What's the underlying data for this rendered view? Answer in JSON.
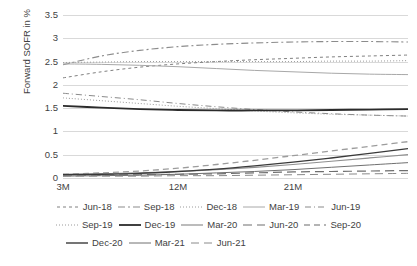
{
  "chart_data": {
    "type": "line",
    "title": "",
    "xlabel": "",
    "ylabel": "Forward SOFR in %",
    "ylim": [
      0,
      3.5
    ],
    "yticks": [
      "0",
      "0.5",
      "1",
      "1.5",
      "2",
      "2.5",
      "3",
      "3.5"
    ],
    "ytick_values": [
      0,
      0.5,
      1,
      1.5,
      2,
      2.5,
      3,
      3.5
    ],
    "grid": true,
    "legend_position": "bottom",
    "x": [
      3,
      6,
      9,
      12,
      15,
      18,
      21,
      24,
      27,
      30
    ],
    "xtick_labels": [
      "3M",
      "12M",
      "21M"
    ],
    "xtick_values": [
      3,
      12,
      21
    ],
    "series": [
      {
        "name": "Jun-18",
        "color": "#808080",
        "dash": "3,3",
        "width": 1.0,
        "values": [
          2.15,
          2.28,
          2.38,
          2.45,
          2.5,
          2.54,
          2.57,
          2.6,
          2.62,
          2.64
        ]
      },
      {
        "name": "Sep-18",
        "color": "#8c8c8c",
        "dash": "7,3,2,3",
        "width": 1.1,
        "values": [
          2.43,
          2.62,
          2.74,
          2.82,
          2.87,
          2.9,
          2.92,
          2.93,
          2.93,
          2.92
        ]
      },
      {
        "name": "Dec-18",
        "color": "#9a9a9a",
        "dash": "1,2",
        "width": 1.0,
        "values": [
          2.48,
          2.49,
          2.5,
          2.5,
          2.5,
          2.5,
          2.5,
          2.51,
          2.51,
          2.52
        ]
      },
      {
        "name": "Mar-19",
        "color": "#a8a8a8",
        "dash": "none",
        "width": 1.0,
        "values": [
          2.45,
          2.44,
          2.42,
          2.39,
          2.35,
          2.31,
          2.28,
          2.25,
          2.23,
          2.22
        ]
      },
      {
        "name": "Jun-19",
        "color": "#8a8a8a",
        "dash": "6,3,1,3",
        "width": 1.0,
        "values": [
          1.82,
          1.75,
          1.68,
          1.6,
          1.53,
          1.47,
          1.42,
          1.38,
          1.35,
          1.33
        ]
      },
      {
        "name": "Sep-19",
        "color": "#9a9a9a",
        "dash": "1,2",
        "width": 1.0,
        "values": [
          1.72,
          1.66,
          1.6,
          1.54,
          1.49,
          1.44,
          1.4,
          1.37,
          1.35,
          1.33
        ]
      },
      {
        "name": "Dec-19",
        "color": "#2b2b2b",
        "dash": "none",
        "width": 1.8,
        "values": [
          1.55,
          1.51,
          1.48,
          1.46,
          1.45,
          1.45,
          1.45,
          1.46,
          1.47,
          1.48
        ]
      },
      {
        "name": "Mar-20",
        "color": "#8f8f8f",
        "dash": "none",
        "width": 1.2,
        "values": [
          0.08,
          0.09,
          0.11,
          0.14,
          0.18,
          0.23,
          0.29,
          0.36,
          0.43,
          0.5
        ]
      },
      {
        "name": "Jun-20",
        "color": "#6e6e6e",
        "dash": "9,5",
        "width": 1.2,
        "values": [
          0.06,
          0.06,
          0.07,
          0.08,
          0.09,
          0.11,
          0.13,
          0.14,
          0.15,
          0.16
        ]
      },
      {
        "name": "Sep-20",
        "color": "#9c9c9c",
        "dash": "6,4",
        "width": 1.3,
        "values": [
          0.08,
          0.11,
          0.15,
          0.21,
          0.29,
          0.38,
          0.48,
          0.58,
          0.68,
          0.78
        ]
      },
      {
        "name": "Dec-20",
        "color": "#3a3a3a",
        "dash": "none",
        "width": 1.4,
        "values": [
          0.07,
          0.08,
          0.1,
          0.14,
          0.19,
          0.26,
          0.34,
          0.43,
          0.53,
          0.63
        ]
      },
      {
        "name": "Mar-21",
        "color": "#707070",
        "dash": "none",
        "width": 1.0,
        "values": [
          0.04,
          0.05,
          0.06,
          0.08,
          0.11,
          0.14,
          0.18,
          0.23,
          0.28,
          0.33
        ]
      },
      {
        "name": "Jun-21",
        "color": "#8a8a8a",
        "dash": "8,5",
        "width": 1.0,
        "values": [
          0.04,
          0.04,
          0.04,
          0.05,
          0.05,
          0.06,
          0.07,
          0.08,
          0.09,
          0.1
        ]
      }
    ]
  },
  "legend_rows": [
    [
      "Jun-18",
      "Sep-18",
      "Dec-18",
      "Mar-19",
      "Jun-19"
    ],
    [
      "Sep-19",
      "Dec-19",
      "Mar-20",
      "Jun-20",
      "Sep-20"
    ],
    [
      "Dec-20",
      "Mar-21",
      "Jun-21"
    ]
  ]
}
